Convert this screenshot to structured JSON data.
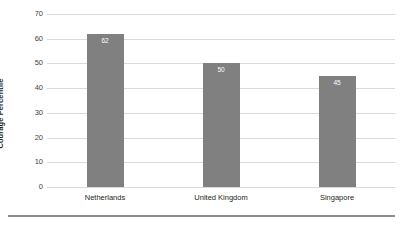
{
  "chart_data": {
    "type": "bar",
    "title": "",
    "subtitle": "",
    "xlabel": "",
    "ylabel": "Courage Percentile",
    "categories": [
      "Netherlands",
      "United Kingdom",
      "Singapore"
    ],
    "values": [
      62,
      50,
      45
    ],
    "data_labels": [
      "62",
      "50",
      "45"
    ],
    "ylim": [
      0,
      70
    ],
    "yticks": [
      0,
      10,
      20,
      30,
      40,
      50,
      60,
      70
    ],
    "ytick_labels": [
      "0",
      "10",
      "20",
      "30",
      "40",
      "50",
      "60",
      "70"
    ],
    "grid": true,
    "grid_axis": "y",
    "legend": false,
    "legend_position": "none",
    "series": [
      {
        "name": "Courage Percentile",
        "values": [
          62,
          50,
          45
        ],
        "color": "#808080"
      }
    ]
  },
  "colors": {
    "bar_fill": "#808080",
    "gridline": "#d9d9d9",
    "axis_text": "#3f3f3f",
    "label_text": "#231f20",
    "value_text": "#ffffff",
    "background": "#ffffff",
    "bottom_rule": "#8c8c8c"
  }
}
